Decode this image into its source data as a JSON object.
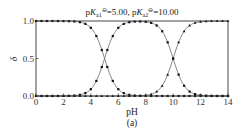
{
  "chart_data": {
    "type": "line",
    "title": "pKa1⊖=5.00, pKa2⊖=10.00",
    "title_parts": {
      "p1": "p",
      "k1": "K",
      "sub1": "a1",
      "sup1": "⊖",
      "v1": "=5.00, ",
      "p2": "p",
      "k2": "K",
      "sub2": "a2",
      "sup2": "⊖",
      "v2": "=10.00"
    },
    "xlabel": "pH",
    "ylabel": "δ",
    "caption": "(a)",
    "xlim": [
      0,
      14
    ],
    "ylim": [
      0,
      1
    ],
    "xticks": [
      0,
      2,
      4,
      6,
      8,
      10,
      12,
      14
    ],
    "yticks": [
      0.0,
      0.5,
      1.0
    ],
    "ytick_labels": [
      "0.0",
      "0.5",
      "1.0"
    ],
    "grid": false,
    "legend": null,
    "pKa1": 5.0,
    "pKa2": 10.0,
    "x": [
      0,
      0.5,
      1,
      1.5,
      2,
      2.5,
      3,
      3.5,
      4,
      4.5,
      5,
      5.5,
      6,
      6.5,
      7,
      7.5,
      8,
      8.5,
      9,
      9.5,
      10,
      10.5,
      11,
      11.5,
      12,
      12.5,
      13,
      13.5,
      14
    ],
    "series": [
      {
        "name": "δ0 (H2A)",
        "marker": "square",
        "values": [
          1.0,
          1.0,
          1.0,
          1.0,
          1.0,
          1.0,
          0.99,
          0.969,
          0.909,
          0.76,
          0.5,
          0.24,
          0.091,
          0.031,
          0.01,
          0.003,
          0.001,
          0.0,
          0.0,
          0.0,
          0.0,
          0.0,
          0.0,
          0.0,
          0.0,
          0.0,
          0.0,
          0.0,
          0.0
        ]
      },
      {
        "name": "δ1 (HA-)",
        "marker": "square",
        "values": [
          0.0,
          0.0,
          0.0,
          0.0,
          0.0,
          0.003,
          0.01,
          0.031,
          0.091,
          0.24,
          0.5,
          0.76,
          0.909,
          0.969,
          0.99,
          0.997,
          0.999,
          0.997,
          0.99,
          0.969,
          0.5,
          0.24,
          0.091,
          0.031,
          0.01,
          0.003,
          0.001,
          0.0,
          0.0
        ]
      },
      {
        "name": "δ2 (A2-)",
        "marker": "triangle",
        "values": [
          0.0,
          0.0,
          0.0,
          0.0,
          0.0,
          0.0,
          0.0,
          0.0,
          0.0,
          0.0,
          0.0,
          0.0,
          0.0,
          0.0,
          0.0,
          0.0,
          0.001,
          0.003,
          0.01,
          0.031,
          0.5,
          0.76,
          0.909,
          0.969,
          0.99,
          0.997,
          0.999,
          1.0,
          1.0
        ]
      }
    ]
  }
}
